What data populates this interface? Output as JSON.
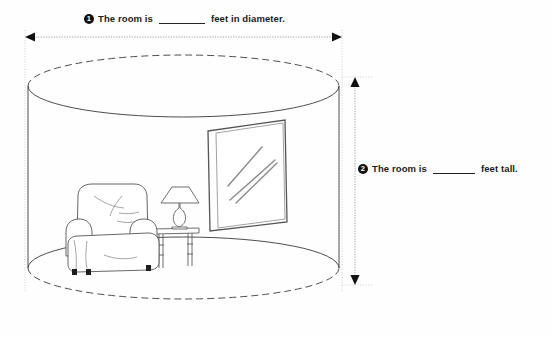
{
  "worksheet": {
    "type": "geometry-measurement-worksheet",
    "background_color": "#fefefe",
    "ink_color": "#3a3a3a",
    "text_color": "#1b1b1b"
  },
  "questions": [
    {
      "number": "1",
      "badge": "1",
      "text_before": "The room is",
      "blank": "",
      "text_after": "feet in diameter.",
      "measures": "diameter",
      "position": "top"
    },
    {
      "number": "2",
      "badge": "2",
      "text_before": "The room is",
      "blank": "",
      "text_after": "feet tall.",
      "measures": "height",
      "position": "right"
    }
  ],
  "illustration": {
    "subject": "cylindrical room interior",
    "shape": "cylinder",
    "objects": [
      "recliner-armchair",
      "side-table",
      "table-lamp",
      "window"
    ],
    "dimension_lines": [
      {
        "name": "diameter",
        "orientation": "horizontal",
        "arrows": "both-ends",
        "style": "dotted"
      },
      {
        "name": "height",
        "orientation": "vertical",
        "arrows": "both-ends",
        "style": "dotted"
      }
    ]
  }
}
